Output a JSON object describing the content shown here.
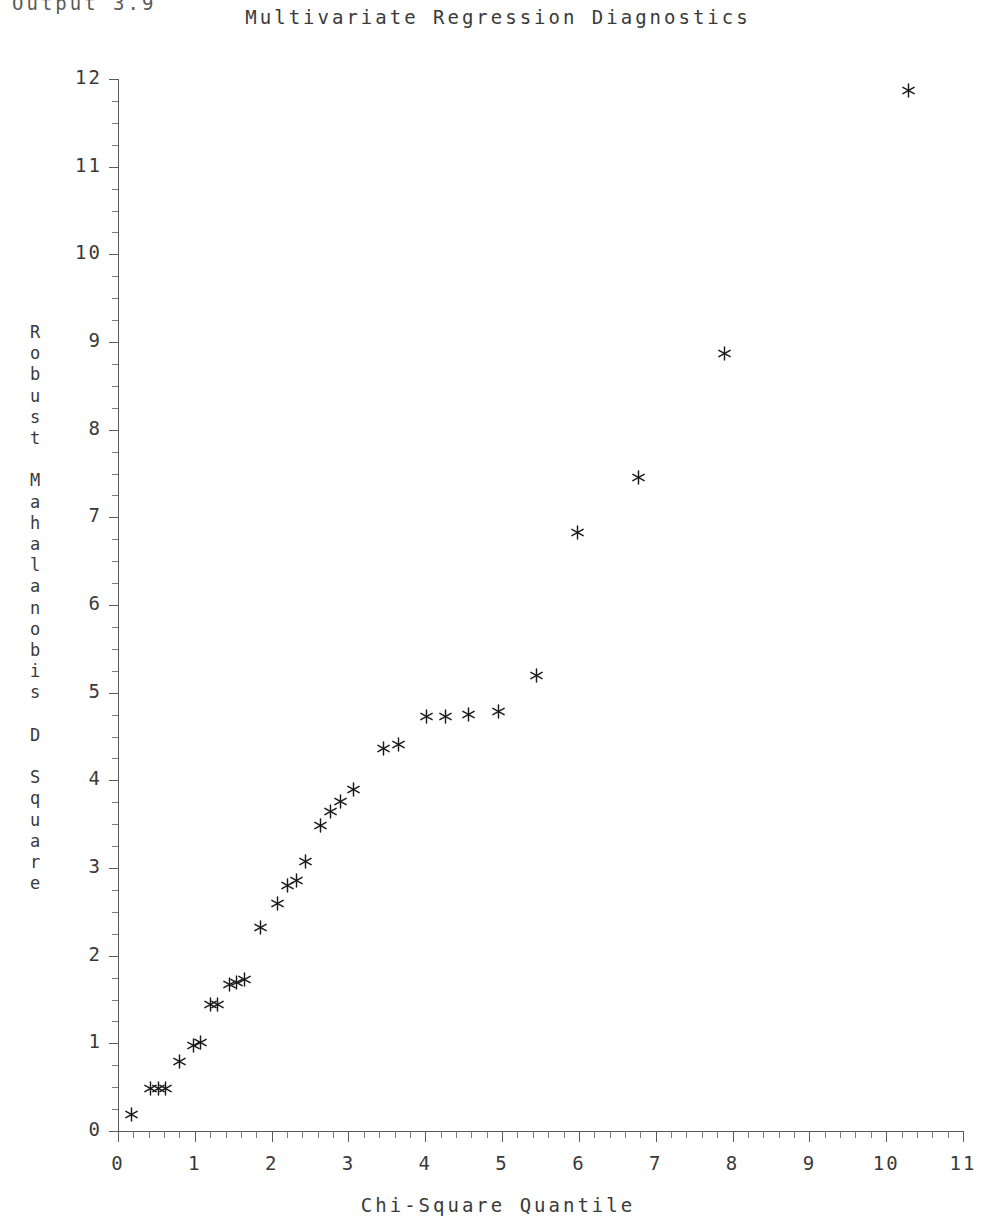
{
  "header": {
    "output_label": "Output 3.9",
    "title": "Multivariate Regression Diagnostics"
  },
  "axis": {
    "y_title_chars": "R\no\nb\nu\ns\nt\n\nM\na\nh\na\nl\na\nn\no\nb\ni\ns\n\nD\n\nS\nq\nu\na\nr\ne",
    "x_title": "Chi-Square Quantile"
  },
  "chart_data": {
    "type": "scatter",
    "title": "Multivariate Regression Diagnostics",
    "xlabel": "Chi-Square Quantile",
    "ylabel": "Robust Mahalanobis D Square",
    "xlim": [
      0,
      11
    ],
    "ylim": [
      0,
      12
    ],
    "xticks": [
      0,
      1,
      2,
      3,
      4,
      5,
      6,
      7,
      8,
      9,
      10,
      11
    ],
    "xtick_labels": [
      "0",
      "1",
      "2",
      "3",
      "4",
      "5",
      "6",
      "7",
      "8",
      "9",
      "10",
      "11"
    ],
    "yticks": [
      0,
      1,
      2,
      3,
      4,
      5,
      6,
      7,
      8,
      9,
      10,
      11,
      12
    ],
    "ytick_labels": [
      "0",
      "1",
      "2",
      "3",
      "4",
      "5",
      "6",
      "7",
      "8",
      "9",
      "10",
      "11",
      "12"
    ],
    "x_minor_step": 0.2,
    "y_minor_step": 0.25,
    "grid": false,
    "legend": null,
    "marker": "asterisk",
    "marker_color": "#1a1a1a",
    "n_points": 36,
    "points": [
      {
        "x": 0.18,
        "y": 0.19
      },
      {
        "x": 0.42,
        "y": 0.49
      },
      {
        "x": 0.53,
        "y": 0.49
      },
      {
        "x": 0.62,
        "y": 0.49
      },
      {
        "x": 0.8,
        "y": 0.79
      },
      {
        "x": 0.98,
        "y": 0.97
      },
      {
        "x": 1.07,
        "y": 1.01
      },
      {
        "x": 1.21,
        "y": 1.44
      },
      {
        "x": 1.3,
        "y": 1.44
      },
      {
        "x": 1.45,
        "y": 1.67
      },
      {
        "x": 1.54,
        "y": 1.69
      },
      {
        "x": 1.65,
        "y": 1.73
      },
      {
        "x": 1.86,
        "y": 2.32
      },
      {
        "x": 2.07,
        "y": 2.59
      },
      {
        "x": 2.21,
        "y": 2.8
      },
      {
        "x": 2.33,
        "y": 2.86
      },
      {
        "x": 2.44,
        "y": 3.07
      },
      {
        "x": 2.63,
        "y": 3.49
      },
      {
        "x": 2.76,
        "y": 3.65
      },
      {
        "x": 2.89,
        "y": 3.76
      },
      {
        "x": 3.06,
        "y": 3.89
      },
      {
        "x": 3.46,
        "y": 4.36
      },
      {
        "x": 3.65,
        "y": 4.41
      },
      {
        "x": 4.02,
        "y": 4.73
      },
      {
        "x": 4.26,
        "y": 4.73
      },
      {
        "x": 4.56,
        "y": 4.75
      },
      {
        "x": 4.95,
        "y": 4.79
      },
      {
        "x": 5.45,
        "y": 5.2
      },
      {
        "x": 5.98,
        "y": 6.83
      },
      {
        "x": 6.77,
        "y": 7.46
      },
      {
        "x": 7.9,
        "y": 8.87
      },
      {
        "x": 10.29,
        "y": 11.87
      }
    ]
  }
}
